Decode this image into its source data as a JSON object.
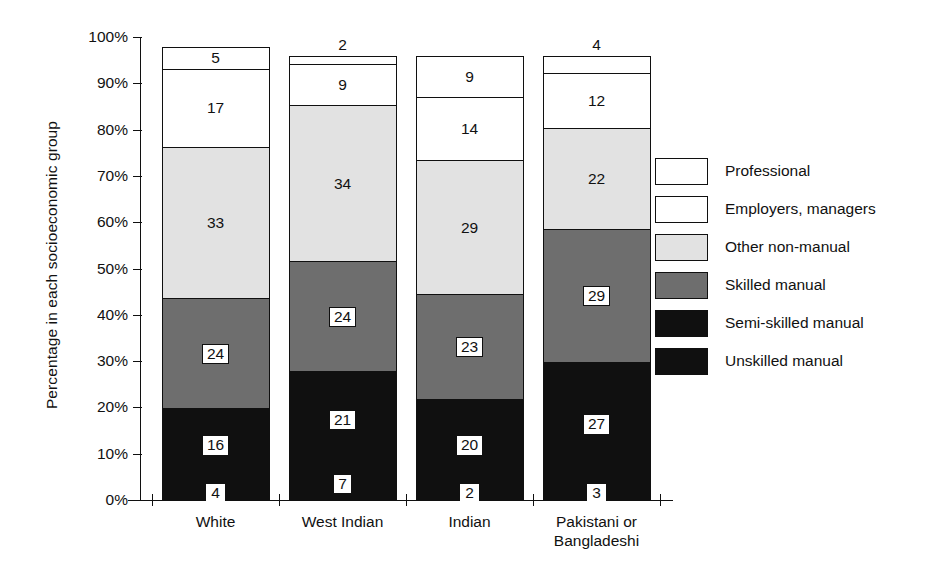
{
  "chart_data": {
    "type": "bar",
    "subtype": "stacked-bar-100-percent",
    "title": "",
    "xlabel": "",
    "ylabel": "Percentage in each socioeconomic group",
    "ylim": [
      0,
      100
    ],
    "y_tick_labels": [
      "0%",
      "10%",
      "20%",
      "30%",
      "40%",
      "50%",
      "60%",
      "70%",
      "80%",
      "90%",
      "100%"
    ],
    "y_tick_values": [
      0,
      10,
      20,
      30,
      40,
      50,
      60,
      70,
      80,
      90,
      100
    ],
    "grid": false,
    "legend_position": "right",
    "categories": [
      "White",
      "West Indian",
      "Indian",
      "Pakistani or Bangladeshi"
    ],
    "category_lines": [
      [
        "White"
      ],
      [
        "West Indian"
      ],
      [
        "Indian"
      ],
      [
        "Pakistani or",
        "Bangladeshi"
      ]
    ],
    "stack_order_bottom_to_top": [
      "Unskilled manual",
      "Semi-skilled manual",
      "Skilled manual",
      "Other non-manual",
      "Employers, managers",
      "Professional"
    ],
    "series": [
      {
        "name": "Unskilled manual",
        "fill": "dark",
        "values": [
          4,
          7,
          2,
          3
        ]
      },
      {
        "name": "Semi-skilled manual",
        "fill": "dark",
        "values": [
          16,
          21,
          20,
          27
        ]
      },
      {
        "name": "Skilled manual",
        "fill": "mid",
        "values": [
          24,
          24,
          23,
          29
        ]
      },
      {
        "name": "Other non-manual",
        "fill": "light",
        "values": [
          33,
          34,
          29,
          22
        ]
      },
      {
        "name": "Employers, managers",
        "fill": "white",
        "values": [
          17,
          9,
          14,
          12
        ]
      },
      {
        "name": "Professional",
        "fill": "white",
        "values": [
          5,
          2,
          9,
          4
        ]
      }
    ],
    "bars": [
      {
        "category": "White",
        "segments": [
          {
            "label": "Unskilled manual",
            "value": 4,
            "fill": "dark",
            "sliver_bottom": true
          },
          {
            "label": "Semi-skilled manual",
            "value": 16,
            "fill": "dark"
          },
          {
            "label": "Skilled manual",
            "value": 24,
            "fill": "mid"
          },
          {
            "label": "Other non-manual",
            "value": 33,
            "fill": "light"
          },
          {
            "label": "Employers, managers",
            "value": 17,
            "fill": "white"
          },
          {
            "label": "Professional",
            "value": 5,
            "fill": "white"
          }
        ]
      },
      {
        "category": "West Indian",
        "segments": [
          {
            "label": "Unskilled manual",
            "value": 7,
            "fill": "dark"
          },
          {
            "label": "Semi-skilled manual",
            "value": 21,
            "fill": "dark"
          },
          {
            "label": "Skilled manual",
            "value": 24,
            "fill": "mid"
          },
          {
            "label": "Other non-manual",
            "value": 34,
            "fill": "light"
          },
          {
            "label": "Employers, managers",
            "value": 9,
            "fill": "white"
          },
          {
            "label": "Professional",
            "value": 2,
            "fill": "white",
            "sliver": true
          }
        ]
      },
      {
        "category": "Indian",
        "segments": [
          {
            "label": "Unskilled manual",
            "value": 2,
            "fill": "dark",
            "sliver_bottom": true
          },
          {
            "label": "Semi-skilled manual",
            "value": 20,
            "fill": "dark"
          },
          {
            "label": "Skilled manual",
            "value": 23,
            "fill": "mid"
          },
          {
            "label": "Other non-manual",
            "value": 29,
            "fill": "light"
          },
          {
            "label": "Employers, managers",
            "value": 14,
            "fill": "white"
          },
          {
            "label": "Professional",
            "value": 9,
            "fill": "white"
          }
        ]
      },
      {
        "category": "Pakistani or Bangladeshi",
        "segments": [
          {
            "label": "Unskilled manual",
            "value": 3,
            "fill": "dark",
            "sliver_bottom": true
          },
          {
            "label": "Semi-skilled manual",
            "value": 27,
            "fill": "dark"
          },
          {
            "label": "Skilled manual",
            "value": 29,
            "fill": "mid"
          },
          {
            "label": "Other non-manual",
            "value": 22,
            "fill": "light"
          },
          {
            "label": "Employers, managers",
            "value": 12,
            "fill": "white"
          },
          {
            "label": "Professional",
            "value": 4,
            "fill": "white",
            "sliver": true
          }
        ]
      }
    ],
    "legend": [
      {
        "label": "Professional",
        "fill": "white"
      },
      {
        "label": "Employers, managers",
        "fill": "white"
      },
      {
        "label": "Other non-manual",
        "fill": "light"
      },
      {
        "label": "Skilled manual",
        "fill": "mid"
      },
      {
        "label": "Semi-skilled manual",
        "fill": "dark"
      },
      {
        "label": "Unskilled manual",
        "fill": "dark"
      }
    ],
    "colors": {
      "white": "#ffffff",
      "light": "#e2e2e2",
      "mid": "#6e6e6e",
      "dark": "#101010",
      "axis": "#101010",
      "text": "#111111",
      "background": "#ffffff"
    }
  }
}
